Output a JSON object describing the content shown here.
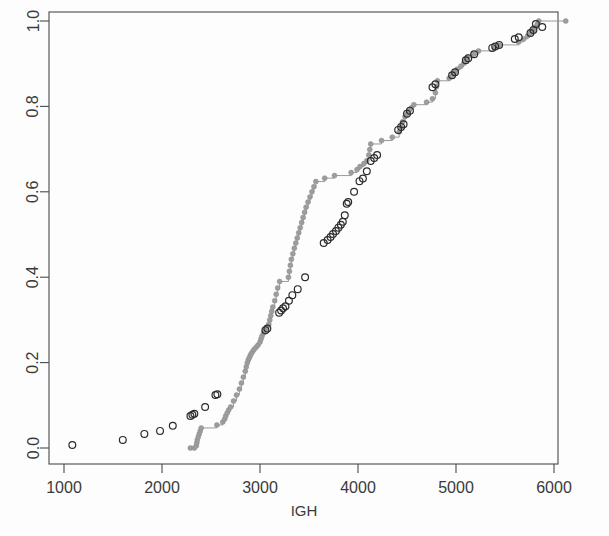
{
  "chart_data": {
    "type": "line",
    "title": "",
    "subtitle": "",
    "xlabel": "IGH",
    "ylabel": "",
    "xlim": [
      900,
      6150
    ],
    "ylim": [
      -0.02,
      1.02
    ],
    "grid": false,
    "legend": null,
    "xticks": [
      1000,
      2000,
      3000,
      4000,
      5000,
      6000
    ],
    "xticklabels": [
      "1000",
      "2000",
      "3000",
      "4000",
      "5000",
      "6000"
    ],
    "yticks": [
      0.0,
      0.2,
      0.4,
      0.6,
      0.8,
      1.0
    ],
    "yticklabels": [
      "0.0",
      "0.2",
      "0.4",
      "0.6",
      "0.8",
      "1.0"
    ],
    "colors": {
      "empirical_cdf": "#9d9d9d",
      "fitted_points": "#2b2b2b",
      "axis": "#4a4a4a",
      "background": "#ffffff"
    },
    "series": [
      {
        "name": "empirical-step-cdf",
        "marker": "filled-circle",
        "color": "#9d9d9d",
        "draw_step": true,
        "points": [
          [
            2290,
            0.0
          ],
          [
            2330,
            0.0
          ],
          [
            2350,
            0.005
          ],
          [
            2355,
            0.012
          ],
          [
            2360,
            0.019
          ],
          [
            2370,
            0.026
          ],
          [
            2380,
            0.033
          ],
          [
            2390,
            0.04
          ],
          [
            2400,
            0.047
          ],
          [
            2560,
            0.054
          ],
          [
            2620,
            0.061
          ],
          [
            2640,
            0.068
          ],
          [
            2650,
            0.075
          ],
          [
            2665,
            0.082
          ],
          [
            2680,
            0.089
          ],
          [
            2700,
            0.096
          ],
          [
            2730,
            0.11
          ],
          [
            2760,
            0.124
          ],
          [
            2790,
            0.138
          ],
          [
            2810,
            0.152
          ],
          [
            2830,
            0.166
          ],
          [
            2850,
            0.18
          ],
          [
            2860,
            0.19
          ],
          [
            2870,
            0.199
          ],
          [
            2880,
            0.206
          ],
          [
            2890,
            0.211
          ],
          [
            2900,
            0.216
          ],
          [
            2910,
            0.221
          ],
          [
            2925,
            0.226
          ],
          [
            2940,
            0.231
          ],
          [
            2960,
            0.236
          ],
          [
            2980,
            0.241
          ],
          [
            3000,
            0.248
          ],
          [
            3010,
            0.255
          ],
          [
            3020,
            0.262
          ],
          [
            3035,
            0.269
          ],
          [
            3050,
            0.276
          ],
          [
            3070,
            0.283
          ],
          [
            3090,
            0.29
          ],
          [
            3100,
            0.3
          ],
          [
            3110,
            0.31
          ],
          [
            3120,
            0.32
          ],
          [
            3130,
            0.33
          ],
          [
            3150,
            0.345
          ],
          [
            3165,
            0.36
          ],
          [
            3180,
            0.375
          ],
          [
            3200,
            0.39
          ],
          [
            3290,
            0.4
          ],
          [
            3300,
            0.414
          ],
          [
            3310,
            0.428
          ],
          [
            3320,
            0.442
          ],
          [
            3335,
            0.455
          ],
          [
            3350,
            0.468
          ],
          [
            3365,
            0.48
          ],
          [
            3380,
            0.492
          ],
          [
            3395,
            0.504
          ],
          [
            3410,
            0.516
          ],
          [
            3425,
            0.528
          ],
          [
            3440,
            0.54
          ],
          [
            3455,
            0.552
          ],
          [
            3470,
            0.564
          ],
          [
            3490,
            0.576
          ],
          [
            3510,
            0.588
          ],
          [
            3530,
            0.6
          ],
          [
            3550,
            0.612
          ],
          [
            3570,
            0.624
          ],
          [
            3660,
            0.632
          ],
          [
            3760,
            0.638
          ],
          [
            3930,
            0.645
          ],
          [
            3990,
            0.652
          ],
          [
            4020,
            0.659
          ],
          [
            4060,
            0.666
          ],
          [
            4090,
            0.673
          ],
          [
            4110,
            0.686
          ],
          [
            4120,
            0.699
          ],
          [
            4130,
            0.712
          ],
          [
            4240,
            0.72
          ],
          [
            4350,
            0.728
          ],
          [
            4420,
            0.74
          ],
          [
            4440,
            0.752
          ],
          [
            4455,
            0.764
          ],
          [
            4480,
            0.776
          ],
          [
            4500,
            0.783
          ],
          [
            4520,
            0.79
          ],
          [
            4545,
            0.797
          ],
          [
            4570,
            0.804
          ],
          [
            4700,
            0.81
          ],
          [
            4760,
            0.818
          ],
          [
            4790,
            0.832
          ],
          [
            4800,
            0.846
          ],
          [
            4810,
            0.86
          ],
          [
            4930,
            0.866
          ],
          [
            4960,
            0.873
          ],
          [
            4990,
            0.88
          ],
          [
            5010,
            0.887
          ],
          [
            5050,
            0.894
          ],
          [
            5080,
            0.901
          ],
          [
            5100,
            0.908
          ],
          [
            5120,
            0.915
          ],
          [
            5180,
            0.922
          ],
          [
            5230,
            0.93
          ],
          [
            5390,
            0.937
          ],
          [
            5440,
            0.944
          ],
          [
            5640,
            0.951
          ],
          [
            5690,
            0.958
          ],
          [
            5730,
            0.965
          ],
          [
            5760,
            0.972
          ],
          [
            5790,
            0.979
          ],
          [
            5810,
            0.986
          ],
          [
            5830,
            0.993
          ],
          [
            5845,
            1.0
          ],
          [
            6120,
            1.0
          ]
        ]
      },
      {
        "name": "open-circle-points",
        "marker": "open-circle",
        "color": "#2b2b2b",
        "draw_step": false,
        "points": [
          [
            1085,
            0.007
          ],
          [
            1600,
            0.019
          ],
          [
            1820,
            0.033
          ],
          [
            1980,
            0.04
          ],
          [
            2110,
            0.052
          ],
          [
            2290,
            0.075
          ],
          [
            2310,
            0.078
          ],
          [
            2330,
            0.08
          ],
          [
            2440,
            0.096
          ],
          [
            2545,
            0.124
          ],
          [
            2565,
            0.126
          ],
          [
            3055,
            0.276
          ],
          [
            3075,
            0.28
          ],
          [
            3195,
            0.317
          ],
          [
            3215,
            0.322
          ],
          [
            3235,
            0.327
          ],
          [
            3260,
            0.332
          ],
          [
            3295,
            0.345
          ],
          [
            3330,
            0.358
          ],
          [
            3385,
            0.372
          ],
          [
            3460,
            0.4
          ],
          [
            3650,
            0.48
          ],
          [
            3690,
            0.487
          ],
          [
            3720,
            0.494
          ],
          [
            3745,
            0.501
          ],
          [
            3775,
            0.508
          ],
          [
            3800,
            0.516
          ],
          [
            3825,
            0.523
          ],
          [
            3845,
            0.53
          ],
          [
            3865,
            0.545
          ],
          [
            3885,
            0.572
          ],
          [
            3900,
            0.576
          ],
          [
            3960,
            0.6
          ],
          [
            4015,
            0.625
          ],
          [
            4050,
            0.631
          ],
          [
            4090,
            0.648
          ],
          [
            4130,
            0.672
          ],
          [
            4165,
            0.679
          ],
          [
            4195,
            0.686
          ],
          [
            4410,
            0.745
          ],
          [
            4440,
            0.752
          ],
          [
            4465,
            0.758
          ],
          [
            4500,
            0.783
          ],
          [
            4530,
            0.79
          ],
          [
            4760,
            0.845
          ],
          [
            4790,
            0.852
          ],
          [
            4960,
            0.873
          ],
          [
            4990,
            0.88
          ],
          [
            5100,
            0.908
          ],
          [
            5125,
            0.913
          ],
          [
            5185,
            0.922
          ],
          [
            5370,
            0.937
          ],
          [
            5400,
            0.94
          ],
          [
            5440,
            0.944
          ],
          [
            5600,
            0.958
          ],
          [
            5640,
            0.962
          ],
          [
            5760,
            0.972
          ],
          [
            5790,
            0.979
          ],
          [
            5815,
            0.993
          ],
          [
            5880,
            0.986
          ]
        ]
      }
    ]
  },
  "axes": {
    "xlabel": "IGH"
  }
}
